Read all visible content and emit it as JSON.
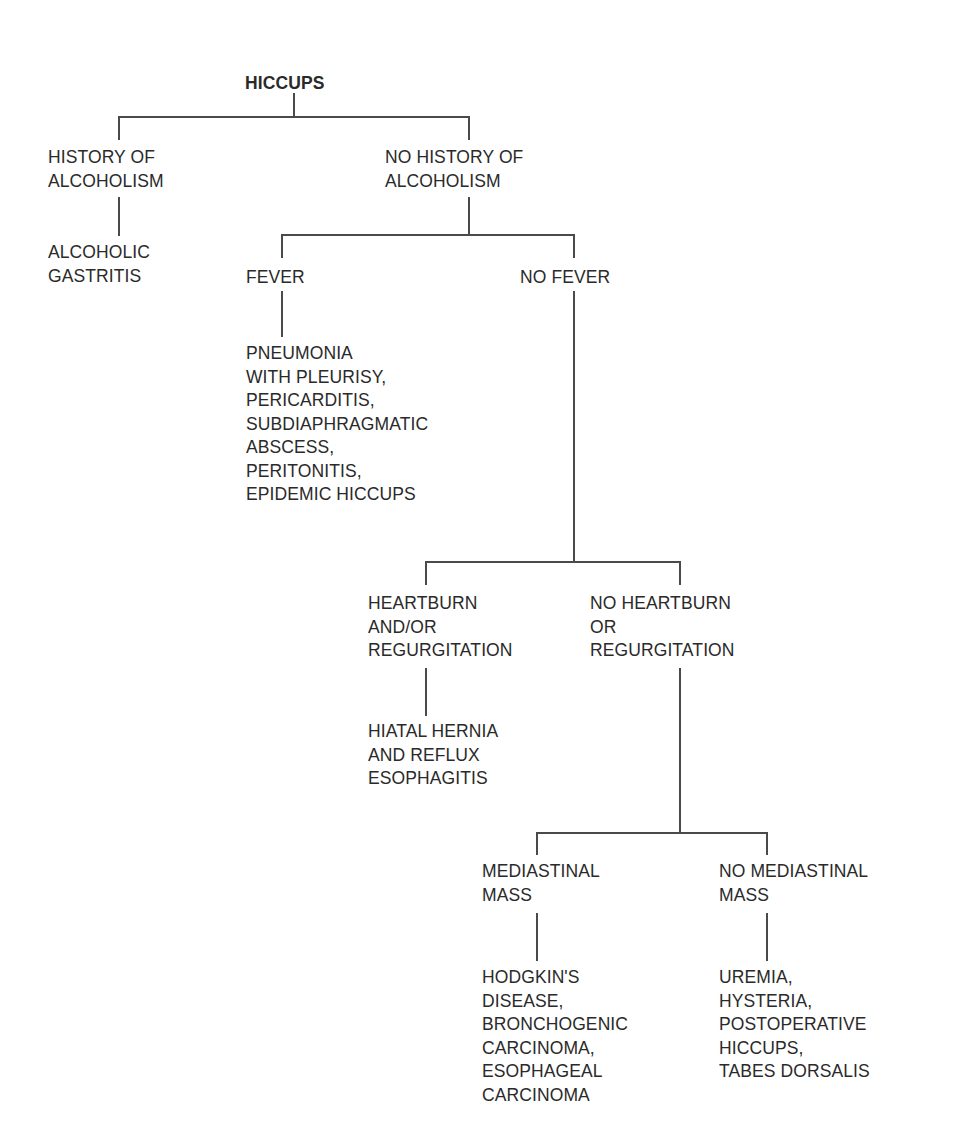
{
  "diagram": {
    "type": "decision-tree",
    "title": "HICCUPS",
    "nodes": {
      "root": {
        "lines": [
          "HICCUPS"
        ]
      },
      "history_alcoholism": {
        "lines": [
          "HISTORY OF",
          "ALCOHOLISM"
        ]
      },
      "alcoholic_gastritis": {
        "lines": [
          "ALCOHOLIC",
          "GASTRITIS"
        ]
      },
      "no_history_alcoholism": {
        "lines": [
          "NO HISTORY OF",
          "ALCOHOLISM"
        ]
      },
      "fever": {
        "lines": [
          "FEVER"
        ]
      },
      "fever_causes": {
        "lines": [
          "PNEUMONIA",
          "WITH PLEURISY,",
          "PERICARDITIS,",
          "SUBDIAPHRAGMATIC",
          "ABSCESS,",
          "PERITONITIS,",
          "EPIDEMIC HICCUPS"
        ]
      },
      "no_fever": {
        "lines": [
          "NO FEVER"
        ]
      },
      "heartburn": {
        "lines": [
          "HEARTBURN",
          "AND/OR",
          "REGURGITATION"
        ]
      },
      "hiatal_hernia": {
        "lines": [
          "HIATAL HERNIA",
          "AND REFLUX",
          "ESOPHAGITIS"
        ]
      },
      "no_heartburn": {
        "lines": [
          "NO HEARTBURN",
          "OR",
          "REGURGITATION"
        ]
      },
      "mediastinal_mass": {
        "lines": [
          "MEDIASTINAL",
          "MASS"
        ]
      },
      "mediastinal_causes": {
        "lines": [
          "HODGKIN'S",
          "DISEASE,",
          "BRONCHOGENIC",
          "CARCINOMA,",
          "ESOPHAGEAL",
          "CARCINOMA"
        ]
      },
      "no_mediastinal_mass": {
        "lines": [
          "NO MEDIASTINAL",
          "MASS"
        ]
      },
      "other_causes": {
        "lines": [
          "UREMIA,",
          "HYSTERIA,",
          "POSTOPERATIVE",
          "HICCUPS,",
          "TABES DORSALIS"
        ]
      }
    },
    "edges": [
      [
        "root",
        "history_alcoholism"
      ],
      [
        "root",
        "no_history_alcoholism"
      ],
      [
        "history_alcoholism",
        "alcoholic_gastritis"
      ],
      [
        "no_history_alcoholism",
        "fever"
      ],
      [
        "no_history_alcoholism",
        "no_fever"
      ],
      [
        "fever",
        "fever_causes"
      ],
      [
        "no_fever",
        "heartburn"
      ],
      [
        "no_fever",
        "no_heartburn"
      ],
      [
        "heartburn",
        "hiatal_hernia"
      ],
      [
        "no_heartburn",
        "mediastinal_mass"
      ],
      [
        "no_heartburn",
        "no_mediastinal_mass"
      ],
      [
        "mediastinal_mass",
        "mediastinal_causes"
      ],
      [
        "no_mediastinal_mass",
        "other_causes"
      ]
    ]
  }
}
